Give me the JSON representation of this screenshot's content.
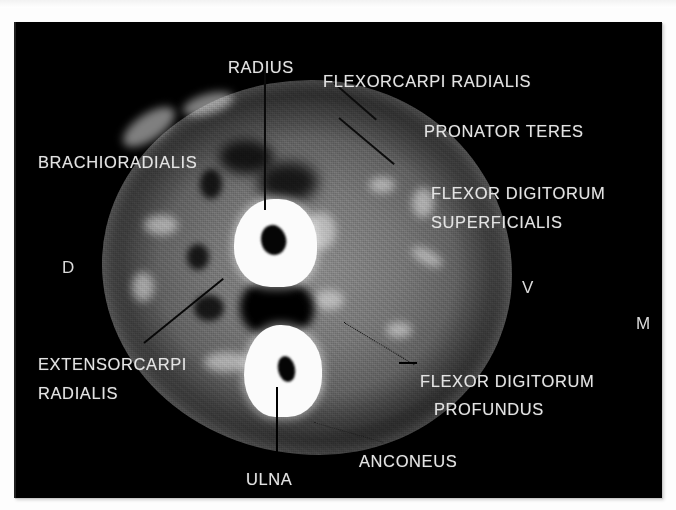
{
  "image": {
    "kind": "ct-cross-section-forearm",
    "background_color": "#000000",
    "page_color": "#ffffff",
    "label_color": "#e3e3e3",
    "bone_color": "#fbfbfb"
  },
  "labels": [
    {
      "id": "radius",
      "text": "RADIUS",
      "leader": "vertical-line"
    },
    {
      "id": "flexor-carpi-radialis",
      "text": "FLEXORCARPI RADIALIS",
      "leader": "diagonal-line"
    },
    {
      "id": "pronator-teres",
      "text": "PRONATOR TERES",
      "leader": "diagonal-line"
    },
    {
      "id": "flexor-digitorum-superficialis-1",
      "text": "FLEXOR DIGITORUM",
      "leader": "none"
    },
    {
      "id": "flexor-digitorum-superficialis-2",
      "text": "SUPERFICIALIS",
      "leader": "none"
    },
    {
      "id": "brachioradialis",
      "text": "BRACHIORADIALIS",
      "leader": "none"
    },
    {
      "id": "extensor-carpi-radialis-1",
      "text": "EXTENSORCARPI",
      "leader": "diagonal-line"
    },
    {
      "id": "extensor-carpi-radialis-2",
      "text": "RADIALIS",
      "leader": "none"
    },
    {
      "id": "flexor-digitorum-profundus-1",
      "text": "FLEXOR DIGITORUM",
      "leader": "dotted-line"
    },
    {
      "id": "flexor-digitorum-profundus-2",
      "text": "PROFUNDUS",
      "leader": "none"
    },
    {
      "id": "anconeus",
      "text": "ANCONEUS",
      "leader": "dotted-line"
    },
    {
      "id": "ulna",
      "text": "ULNA",
      "leader": "arrow-line"
    }
  ],
  "orientation_markers": [
    {
      "id": "dorsal",
      "text": "D"
    },
    {
      "id": "ventral",
      "text": "V"
    },
    {
      "id": "medial",
      "text": "M"
    }
  ]
}
